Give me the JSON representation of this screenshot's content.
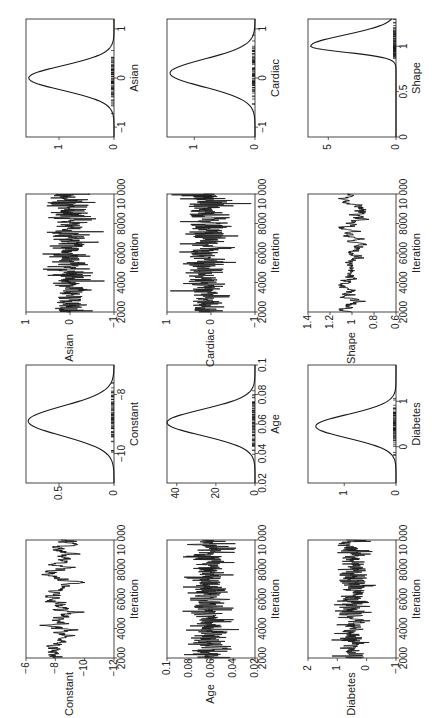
{
  "figure": {
    "orientation": "rotated-90",
    "panels_layout": "2 groups x (trace, density) x 3 variables"
  },
  "chart_data": [
    {
      "type": "line",
      "id": "trace-constant",
      "title": "",
      "xlabel": "Iteration",
      "ylabel": "Constant",
      "xlim": [
        2000,
        10000
      ],
      "ylim": [
        -12,
        -6
      ],
      "xticks": [
        "2000",
        "4000",
        "6000",
        "8000",
        "10 000"
      ],
      "yticks": [
        "-6",
        "-8",
        "-10",
        "-12"
      ],
      "center": -8.3,
      "spread": 0.55,
      "mixing": "slow"
    },
    {
      "type": "line",
      "id": "density-constant",
      "xlabel": "Constant",
      "ylabel": "",
      "xlim": [
        -11,
        -7
      ],
      "ylim": [
        0,
        0.8
      ],
      "xticks": [
        "-10",
        "-8"
      ],
      "yticks": [
        "0",
        "0.5"
      ],
      "mean": -8.9,
      "sd": 0.5,
      "peak": 0.78
    },
    {
      "type": "line",
      "id": "trace-age",
      "xlabel": "Iteration",
      "ylabel": "Age",
      "xlim": [
        2000,
        10000
      ],
      "ylim": [
        0.02,
        0.1
      ],
      "xticks": [
        "2000",
        "4000",
        "6000",
        "8000",
        "10 000"
      ],
      "yticks": [
        "0.02",
        "0.04",
        "0.06",
        "0.08",
        "0.1"
      ],
      "center": 0.061,
      "spread": 0.01,
      "mixing": "good"
    },
    {
      "type": "line",
      "id": "density-age",
      "xlabel": "Age",
      "ylabel": "",
      "xlim": [
        0.02,
        0.1
      ],
      "ylim": [
        0,
        45
      ],
      "xticks": [
        "0.02",
        "0.04",
        "0.06",
        "0.08",
        "0.1"
      ],
      "yticks": [
        "0",
        "20",
        "40"
      ],
      "mean": 0.061,
      "sd": 0.0088,
      "peak": 45
    },
    {
      "type": "line",
      "id": "trace-diabetes",
      "xlabel": "Iteration",
      "ylabel": "Diabetes",
      "xlim": [
        2000,
        10000
      ],
      "ylim": [
        -1,
        2
      ],
      "xticks": [
        "2000",
        "4000",
        "6000",
        "8000",
        "10 000"
      ],
      "yticks": [
        "-1",
        "0",
        "1",
        "2"
      ],
      "center": 0.45,
      "spread": 0.28,
      "mixing": "good"
    },
    {
      "type": "line",
      "id": "density-diabetes",
      "xlabel": "Diabetes",
      "ylabel": "",
      "xlim": [
        -0.8,
        1.8
      ],
      "ylim": [
        0,
        1.7
      ],
      "xticks": [
        "0",
        "1"
      ],
      "yticks": [
        "0",
        "1"
      ],
      "mean": 0.45,
      "sd": 0.26,
      "peak": 1.55
    },
    {
      "type": "line",
      "id": "trace-asian",
      "xlabel": "Iteration",
      "ylabel": "Asian",
      "xlim": [
        2000,
        10000
      ],
      "ylim": [
        -1,
        1
      ],
      "xticks": [
        "2000",
        "4000",
        "6000",
        "8000",
        "10 000"
      ],
      "yticks": [
        "-1",
        "0",
        "1"
      ],
      "center": 0.0,
      "spread": 0.25,
      "mixing": "good"
    },
    {
      "type": "line",
      "id": "density-asian",
      "xlabel": "Asian",
      "ylabel": "",
      "xlim": [
        -1.2,
        1.2
      ],
      "ylim": [
        0,
        1.6
      ],
      "xticks": [
        "-1",
        "0",
        "1"
      ],
      "yticks": [
        "0",
        "1"
      ],
      "mean": 0.0,
      "sd": 0.25,
      "peak": 1.55
    },
    {
      "type": "line",
      "id": "trace-cardiac",
      "xlabel": "Iteration",
      "ylabel": "Cardiac",
      "xlim": [
        2000,
        10000
      ],
      "ylim": [
        -1,
        1
      ],
      "xticks": [
        "2000",
        "4000",
        "6000",
        "8000",
        "10 000"
      ],
      "yticks": [
        "-1",
        "0",
        "1"
      ],
      "center": 0.1,
      "spread": 0.28,
      "mixing": "good"
    },
    {
      "type": "line",
      "id": "density-cardiac",
      "xlabel": "Cardiac",
      "ylabel": "",
      "xlim": [
        -1.2,
        1.2
      ],
      "ylim": [
        0,
        1.45
      ],
      "xticks": [
        "-1",
        "0",
        "1"
      ],
      "yticks": [
        "0",
        "1"
      ],
      "mean": 0.1,
      "sd": 0.28,
      "peak": 1.4
    },
    {
      "type": "line",
      "id": "trace-shape",
      "xlabel": "Iteration",
      "ylabel": "Shape",
      "xlim": [
        2000,
        10000
      ],
      "ylim": [
        0.6,
        1.4
      ],
      "xticks": [
        "2000",
        "4000",
        "6000",
        "8000",
        "10 000"
      ],
      "yticks": [
        "0.6",
        "0.8",
        "1",
        "1.2",
        "1.4"
      ],
      "center": 1.0,
      "spread": 0.06,
      "mixing": "slow"
    },
    {
      "type": "line",
      "id": "density-shape",
      "xlabel": "Shape",
      "ylabel": "",
      "xlim": [
        0,
        1.3
      ],
      "ylim": [
        0,
        6.5
      ],
      "xticks": [
        "0",
        "0.5",
        "1"
      ],
      "yticks": [
        "0",
        "5"
      ],
      "mean": 1.0,
      "sd": 0.065,
      "peak": 6.3,
      "skew": "right"
    }
  ],
  "panel_positions": [
    {
      "id": "density-asian",
      "x": 26,
      "y": 19
    },
    {
      "id": "density-cardiac",
      "x": 167,
      "y": 19
    },
    {
      "id": "density-shape",
      "x": 308,
      "y": 19
    },
    {
      "id": "trace-asian",
      "x": 26,
      "y": 194
    },
    {
      "id": "trace-cardiac",
      "x": 167,
      "y": 194
    },
    {
      "id": "trace-shape",
      "x": 308,
      "y": 194
    },
    {
      "id": "density-constant",
      "x": 26,
      "y": 365
    },
    {
      "id": "density-age",
      "x": 167,
      "y": 365
    },
    {
      "id": "density-diabetes",
      "x": 308,
      "y": 365
    },
    {
      "id": "trace-constant",
      "x": 26,
      "y": 540
    },
    {
      "id": "trace-age",
      "x": 167,
      "y": 540
    },
    {
      "id": "trace-diabetes",
      "x": 308,
      "y": 540
    }
  ],
  "colors": {
    "line": "#1a1a1a",
    "frame": "#333333",
    "background": "#ffffff"
  }
}
